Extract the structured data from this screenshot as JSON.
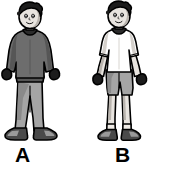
{
  "image": {
    "type": "illustration",
    "description": "Two cartoon drawings of the same boy shown side by side, comparing warm-weather and cold-weather clothing",
    "background_color": "#ffffff",
    "width": 178,
    "height": 170
  },
  "figures": [
    {
      "id": "a",
      "label": "A",
      "pose": "standing, arms down at sides",
      "hair": {
        "name": "short spiky hair",
        "color": "#1c1c1c"
      },
      "skin": {
        "color": "#e8e4df"
      },
      "garments": [
        {
          "name": "long-sleeve sweater",
          "color": "#6d6d6d"
        },
        {
          "name": "long pants",
          "color": "#a5a5a5"
        },
        {
          "name": "gloves",
          "color": "#1c1c1c"
        },
        {
          "name": "sneakers",
          "color": "#4a4a4a"
        }
      ],
      "outline_color": "#000000"
    },
    {
      "id": "b",
      "label": "B",
      "pose": "standing, arms down at sides",
      "hair": {
        "name": "short spiky hair",
        "color": "#1c1c1c"
      },
      "skin": {
        "color": "#e8e4df"
      },
      "garments": [
        {
          "name": "short-sleeve t-shirt",
          "color": "#ffffff"
        },
        {
          "name": "shorts",
          "color": "#a5a5a5"
        },
        {
          "name": "socks",
          "color": "#f0ece7"
        },
        {
          "name": "sneakers",
          "color": "#4a4a4a"
        }
      ],
      "outline_color": "#000000"
    }
  ],
  "labels": {
    "a": "A",
    "b": "B"
  },
  "colors": {
    "outline": "#000000",
    "hair": "#1c1c1c",
    "skin": "#e8e4df",
    "skin_shadow": "#b9b4ae",
    "sweater": "#6d6d6d",
    "sweater_shadow": "#565656",
    "shirt_white": "#ffffff",
    "shirt_shadow": "#d4d0cb",
    "pants": "#a5a5a5",
    "pants_shadow": "#8a8a8a",
    "shoe": "#4a4a4a",
    "shoe_light": "#9a9a9a",
    "glove": "#1c1c1c",
    "label_text": "#000000",
    "background": "#ffffff"
  }
}
